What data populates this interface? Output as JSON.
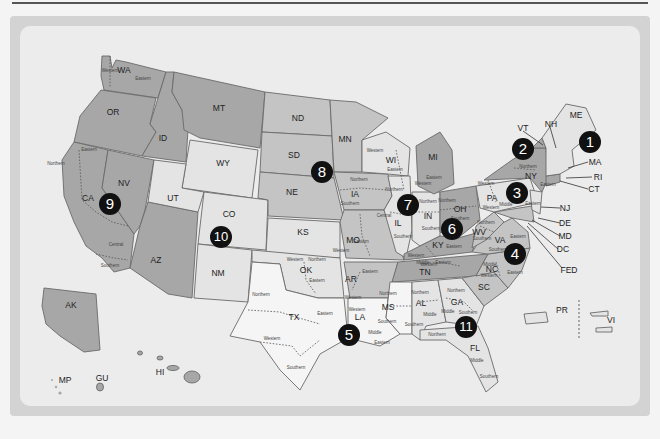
{
  "map": {
    "title": "",
    "colors": {
      "dark": "#a7a7a7",
      "mid": "#c4c4c4",
      "light": "#e4e4e4",
      "white": "#f5f5f5",
      "badge": "#111111",
      "background": "#ececec"
    },
    "circuits": [
      {
        "number": "1",
        "x": 523,
        "y": 145
      },
      {
        "number": "2",
        "x": 523,
        "y": 149
      },
      {
        "number": "3",
        "x": 517,
        "y": 193
      },
      {
        "number": "4",
        "x": 515,
        "y": 254
      },
      {
        "number": "5",
        "x": 349,
        "y": 335
      },
      {
        "number": "6",
        "x": 452,
        "y": 229
      },
      {
        "number": "7",
        "x": 408,
        "y": 205
      },
      {
        "number": "8",
        "x": 322,
        "y": 172
      },
      {
        "number": "9",
        "x": 110,
        "y": 204
      },
      {
        "number": "10",
        "x": 221,
        "y": 237
      },
      {
        "number": "11",
        "x": 466,
        "y": 327
      }
    ],
    "states": [
      {
        "code": "WA",
        "x": 124,
        "y": 70
      },
      {
        "code": "OR",
        "x": 113,
        "y": 112
      },
      {
        "code": "CA",
        "x": 88,
        "y": 198
      },
      {
        "code": "NV",
        "x": 124,
        "y": 183
      },
      {
        "code": "ID",
        "x": 163,
        "y": 138
      },
      {
        "code": "MT",
        "x": 219,
        "y": 108
      },
      {
        "code": "WY",
        "x": 223,
        "y": 163
      },
      {
        "code": "UT",
        "x": 173,
        "y": 198
      },
      {
        "code": "CO",
        "x": 229,
        "y": 214
      },
      {
        "code": "AZ",
        "x": 156,
        "y": 260
      },
      {
        "code": "NM",
        "x": 218,
        "y": 273
      },
      {
        "code": "ND",
        "x": 298,
        "y": 118
      },
      {
        "code": "SD",
        "x": 294,
        "y": 155
      },
      {
        "code": "NE",
        "x": 292,
        "y": 192
      },
      {
        "code": "KS",
        "x": 303,
        "y": 232
      },
      {
        "code": "OK",
        "x": 306,
        "y": 270
      },
      {
        "code": "TX",
        "x": 294,
        "y": 317
      },
      {
        "code": "MN",
        "x": 345,
        "y": 139
      },
      {
        "code": "IA",
        "x": 355,
        "y": 194
      },
      {
        "code": "MO",
        "x": 353,
        "y": 240
      },
      {
        "code": "AR",
        "x": 351,
        "y": 279
      },
      {
        "code": "LA",
        "x": 360,
        "y": 317
      },
      {
        "code": "WI",
        "x": 391,
        "y": 160
      },
      {
        "code": "IL",
        "x": 398,
        "y": 223
      },
      {
        "code": "MI",
        "x": 433,
        "y": 157
      },
      {
        "code": "IN",
        "x": 428,
        "y": 216
      },
      {
        "code": "OH",
        "x": 460,
        "y": 209
      },
      {
        "code": "KY",
        "x": 438,
        "y": 245
      },
      {
        "code": "TN",
        "x": 425,
        "y": 272
      },
      {
        "code": "MS",
        "x": 388,
        "y": 307
      },
      {
        "code": "AL",
        "x": 421,
        "y": 303
      },
      {
        "code": "GA",
        "x": 457,
        "y": 302
      },
      {
        "code": "FL",
        "x": 475,
        "y": 348
      },
      {
        "code": "SC",
        "x": 484,
        "y": 287
      },
      {
        "code": "NC",
        "x": 492,
        "y": 269
      },
      {
        "code": "VA",
        "x": 500,
        "y": 240
      },
      {
        "code": "WV",
        "x": 479,
        "y": 232
      },
      {
        "code": "PA",
        "x": 492,
        "y": 198
      },
      {
        "code": "NY",
        "x": 531,
        "y": 176
      },
      {
        "code": "AK",
        "x": 71,
        "y": 305
      },
      {
        "code": "HI",
        "x": 160,
        "y": 372
      },
      {
        "code": "GU",
        "x": 102,
        "y": 378
      },
      {
        "code": "MP",
        "x": 65,
        "y": 380
      },
      {
        "code": "PR",
        "x": 562,
        "y": 310
      },
      {
        "code": "VI",
        "x": 611,
        "y": 320
      }
    ],
    "leader_labels": [
      {
        "code": "VT",
        "x": 523,
        "y": 128
      },
      {
        "code": "NH",
        "x": 551,
        "y": 124
      },
      {
        "code": "ME",
        "x": 576,
        "y": 115
      },
      {
        "code": "MA",
        "x": 595,
        "y": 162
      },
      {
        "code": "RI",
        "x": 598,
        "y": 177
      },
      {
        "code": "CT",
        "x": 594,
        "y": 189
      },
      {
        "code": "NJ",
        "x": 565,
        "y": 208
      },
      {
        "code": "DE",
        "x": 565,
        "y": 223
      },
      {
        "code": "MD",
        "x": 565,
        "y": 236
      },
      {
        "code": "DC",
        "x": 563,
        "y": 249
      },
      {
        "code": "FED",
        "x": 569,
        "y": 270
      }
    ],
    "districts": [
      {
        "text": "Western",
        "x": 110,
        "y": 70
      },
      {
        "text": "Eastern",
        "x": 143,
        "y": 78
      },
      {
        "text": "Eastern",
        "x": 89,
        "y": 149
      },
      {
        "text": "Northern",
        "x": 56,
        "y": 163
      },
      {
        "text": "Central",
        "x": 116,
        "y": 244
      },
      {
        "text": "Southern",
        "x": 110,
        "y": 265
      },
      {
        "text": "Northern",
        "x": 359,
        "y": 179
      },
      {
        "text": "Southern",
        "x": 350,
        "y": 203
      },
      {
        "text": "Western",
        "x": 375,
        "y": 150
      },
      {
        "text": "Eastern",
        "x": 395,
        "y": 169
      },
      {
        "text": "Eastern",
        "x": 434,
        "y": 177
      },
      {
        "text": "Western",
        "x": 423,
        "y": 183
      },
      {
        "text": "Northern",
        "x": 394,
        "y": 189
      },
      {
        "text": "Central",
        "x": 384,
        "y": 215
      },
      {
        "text": "Southern",
        "x": 403,
        "y": 236
      },
      {
        "text": "Northern",
        "x": 428,
        "y": 201
      },
      {
        "text": "Southern",
        "x": 431,
        "y": 228
      },
      {
        "text": "Northern",
        "x": 447,
        "y": 200
      },
      {
        "text": "Southern",
        "x": 460,
        "y": 218
      },
      {
        "text": "Eastern",
        "x": 361,
        "y": 241
      },
      {
        "text": "Western",
        "x": 341,
        "y": 250
      },
      {
        "text": "Western",
        "x": 295,
        "y": 259
      },
      {
        "text": "Northern",
        "x": 317,
        "y": 259
      },
      {
        "text": "Eastern",
        "x": 317,
        "y": 280
      },
      {
        "text": "Eastern",
        "x": 370,
        "y": 271
      },
      {
        "text": "Western",
        "x": 353,
        "y": 297
      },
      {
        "text": "Northern",
        "x": 261,
        "y": 294
      },
      {
        "text": "Western",
        "x": 272,
        "y": 338
      },
      {
        "text": "Eastern",
        "x": 325,
        "y": 313
      },
      {
        "text": "Southern",
        "x": 296,
        "y": 367
      },
      {
        "text": "Western",
        "x": 357,
        "y": 309
      },
      {
        "text": "Middle",
        "x": 375,
        "y": 332
      },
      {
        "text": "Eastern",
        "x": 382,
        "y": 342
      },
      {
        "text": "Northern",
        "x": 388,
        "y": 293
      },
      {
        "text": "Southern",
        "x": 387,
        "y": 321
      },
      {
        "text": "Northern",
        "x": 420,
        "y": 292
      },
      {
        "text": "Middle",
        "x": 430,
        "y": 314
      },
      {
        "text": "Southern",
        "x": 414,
        "y": 324
      },
      {
        "text": "Northern",
        "x": 456,
        "y": 290
      },
      {
        "text": "Middle",
        "x": 448,
        "y": 311
      },
      {
        "text": "Southern",
        "x": 468,
        "y": 312
      },
      {
        "text": "Northern",
        "x": 437,
        "y": 334
      },
      {
        "text": "Middle",
        "x": 477,
        "y": 360
      },
      {
        "text": "Southern",
        "x": 489,
        "y": 376
      },
      {
        "text": "Western",
        "x": 429,
        "y": 264
      },
      {
        "text": "Middle",
        "x": 423,
        "y": 262
      },
      {
        "text": "Eastern",
        "x": 443,
        "y": 262
      },
      {
        "text": "Western",
        "x": 416,
        "y": 255
      },
      {
        "text": "Eastern",
        "x": 454,
        "y": 246
      },
      {
        "text": "Western",
        "x": 486,
        "y": 183
      },
      {
        "text": "Northern",
        "x": 528,
        "y": 166
      },
      {
        "text": "Eastern",
        "x": 548,
        "y": 184
      },
      {
        "text": "Middle",
        "x": 506,
        "y": 204
      },
      {
        "text": "Western",
        "x": 491,
        "y": 207
      },
      {
        "text": "Eastern",
        "x": 533,
        "y": 203
      },
      {
        "text": "Northern",
        "x": 486,
        "y": 222
      },
      {
        "text": "Southern",
        "x": 482,
        "y": 238
      },
      {
        "text": "Eastern",
        "x": 518,
        "y": 236
      },
      {
        "text": "Western",
        "x": 489,
        "y": 275
      },
      {
        "text": "Middle",
        "x": 490,
        "y": 264
      },
      {
        "text": "Eastern",
        "x": 515,
        "y": 272
      },
      {
        "text": "Southern",
        "x": 498,
        "y": 249
      }
    ]
  }
}
